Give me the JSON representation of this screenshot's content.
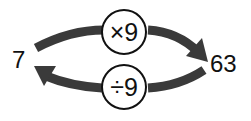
{
  "diagram": {
    "left_value": "7",
    "right_value": "63",
    "forward_operation": "×9",
    "inverse_operation": "÷9",
    "arrow_color": "#3a3a3a",
    "icons": [
      "arrow-right-curved-icon",
      "arrow-left-curved-icon"
    ]
  }
}
